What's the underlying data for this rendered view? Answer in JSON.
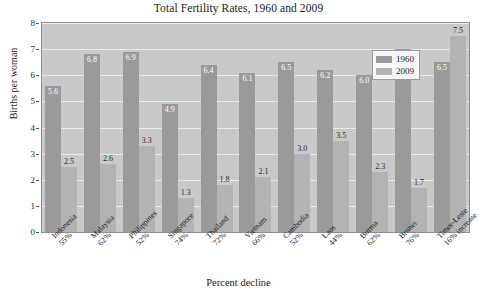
{
  "chart_data": {
    "type": "bar",
    "title": "Total Fertility Rates, 1960 and 2009",
    "xlabel": "Percent decline",
    "ylabel": "Births per woman",
    "ylim": [
      0,
      8
    ],
    "yticks": [
      0,
      1,
      2,
      3,
      4,
      5,
      6,
      7,
      8
    ],
    "grid": true,
    "legend_position": "top-right",
    "categories": [
      "Indonesia",
      "Malaysia",
      "Philippines",
      "Singapore",
      "Thailand",
      "Vietnam",
      "Cambodia",
      "Laos",
      "Burma",
      "Brunei",
      "Timor-Leste"
    ],
    "category_sublabels": [
      "55%",
      "62%",
      "52%",
      "74%",
      "72%",
      "66%",
      "52%",
      "44%",
      "62%",
      "76%",
      "16% increase"
    ],
    "series": [
      {
        "name": "1960",
        "color": "#9a9a9a",
        "values": [
          5.6,
          6.8,
          6.9,
          4.9,
          6.4,
          6.1,
          6.5,
          6.2,
          6.0,
          7.0,
          6.5
        ]
      },
      {
        "name": "2009",
        "color": "#b3b3b3",
        "values": [
          2.5,
          2.6,
          3.3,
          1.3,
          1.8,
          2.1,
          3.0,
          3.5,
          2.3,
          1.7,
          7.5
        ]
      }
    ]
  }
}
